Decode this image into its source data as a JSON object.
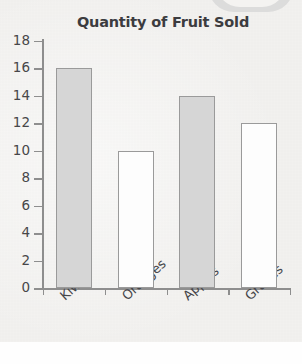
{
  "chart_data": {
    "type": "bar",
    "title": "Quantity of Fruit Sold",
    "xlabel": "",
    "ylabel": "",
    "categories": [
      "Kiwis",
      "Oranges",
      "Apples",
      "Grapes"
    ],
    "values": [
      16,
      10,
      14,
      12
    ],
    "ylim": [
      0,
      18
    ],
    "y_ticks": [
      0,
      2,
      4,
      6,
      8,
      10,
      12,
      14,
      16,
      18
    ],
    "grid": false,
    "legend": null,
    "bar_fills": [
      "#d6d6d6",
      "#fdfdfd",
      "#d6d6d6",
      "#fdfdfd"
    ],
    "bar_border_color": "#9a9a9a",
    "axis_color": "#8e8e8e",
    "title_color": "#3c3c3f",
    "tick_label_color": "#474749",
    "background_color": "#f2f1ef"
  }
}
